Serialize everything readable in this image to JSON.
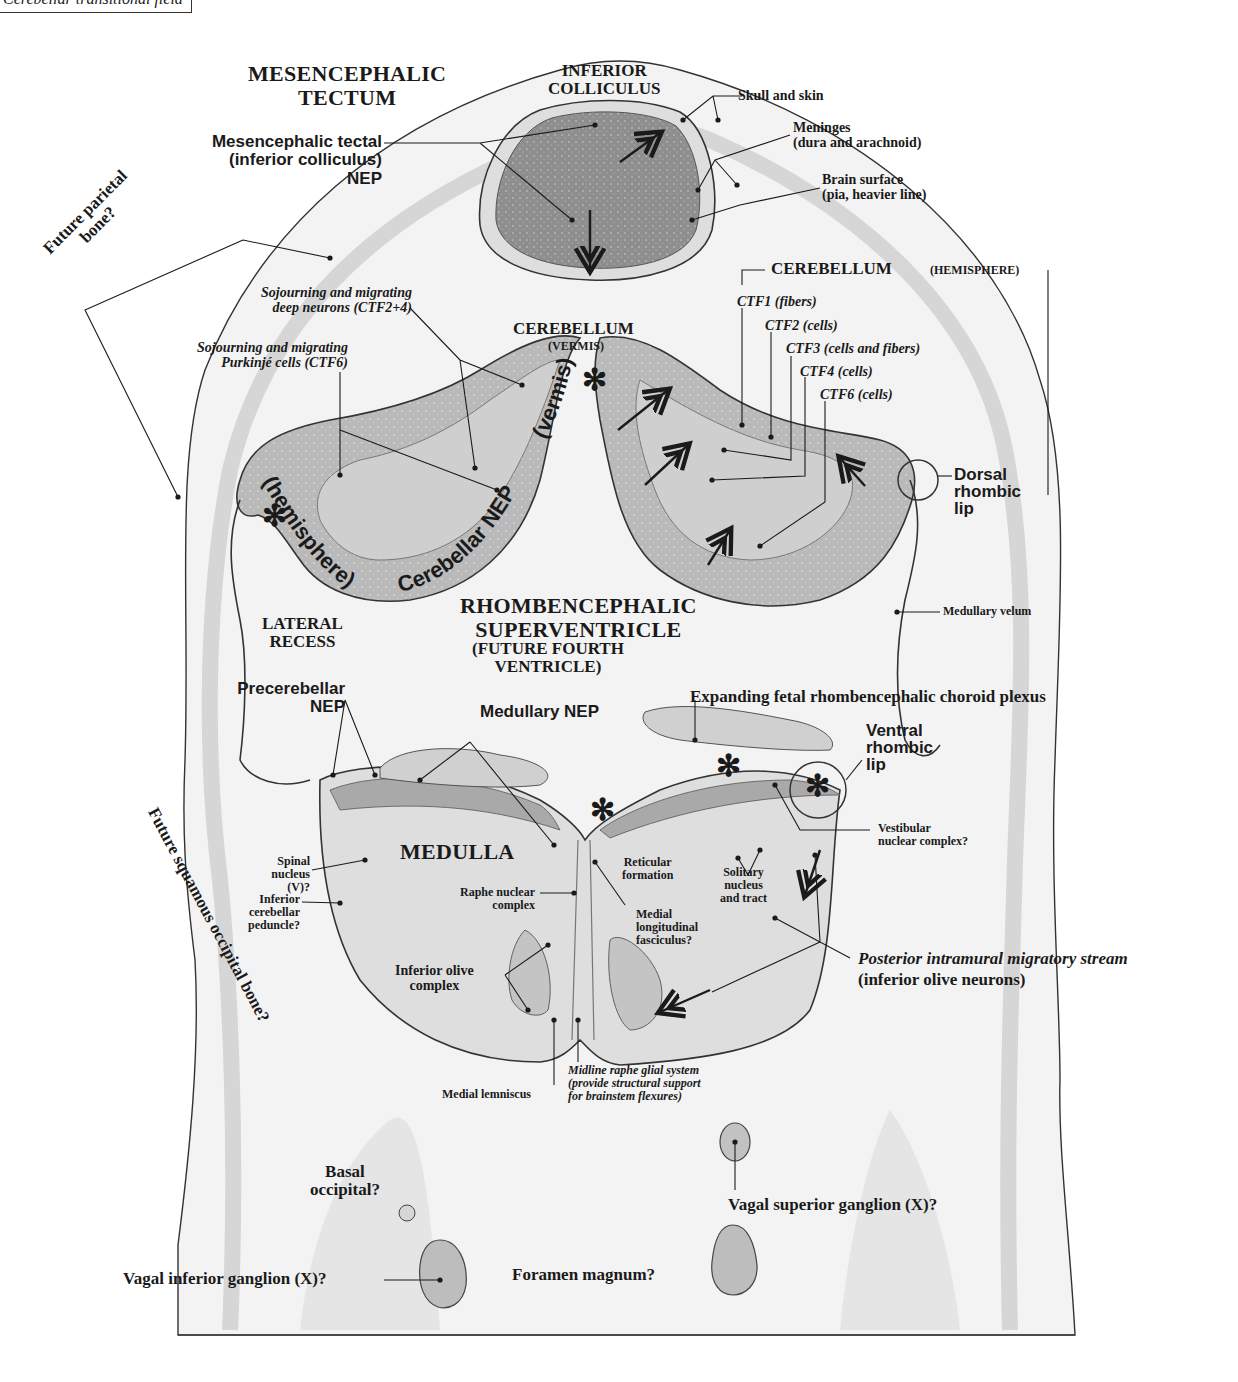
{
  "figure": {
    "header_tab": "Cerebellar transitional field",
    "regions": {
      "mesencephalic_tectum": "MESENCEPHALIC\nTECTUM",
      "inferior_colliculus": "INFERIOR\nCOLLICULUS",
      "cerebellum_vermis": "CEREBELLUM",
      "cerebellum_vermis_sub": "(VERMIS)",
      "cerebellum_hemisphere": "CEREBELLUM",
      "cerebellum_hemisphere_sub": "(HEMISPHERE)",
      "rhombencephalic_superventricle": "RHOMBENCEPHALIC\nSUPERVENTRICLE",
      "future_fourth_ventricle": "(FUTURE FOURTH\nVENTRICLE)",
      "lateral_recess": "LATERAL\nRECESS",
      "medulla": "MEDULLA"
    },
    "labels": {
      "skull_and_skin": "Skull and skin",
      "meninges": "Meninges\n(dura and arachnoid)",
      "brain_surface": "Brain surface\n(pia, heavier line)",
      "mesencephalic_tectal_nep": "Mesencephalic tectal\n(inferior colliculus)\nNEP",
      "future_parietal_bone": "Future parietal\nbone?",
      "sojourning_deep_neurons": "Sojourning and migrating\ndeep neurons (CTF2+4)",
      "sojourning_purkinje": "Sojourning and migrating\nPurkinjé cells (CTF6)",
      "ctf1": "CTF1 (fibers)",
      "ctf2": "CTF2 (cells)",
      "ctf3": "CTF3 (cells and fibers)",
      "ctf4": "CTF4 (cells)",
      "ctf6": "CTF6 (cells)",
      "hemisphere_curved": "(hemisphere)",
      "cerebellar_nep_curved": "Cerebellar NEP",
      "vermis_curved": "(vermis)",
      "dorsal_rhombic_lip": "Dorsal\nrhombic\nlip",
      "medullary_velum": "Medullary velum",
      "precerebellar_nep": "Precerebellar\nNEP",
      "medullary_nep": "Medullary NEP",
      "choroid_plexus": "Expanding fetal rhombencephalic choroid plexus",
      "ventral_rhombic_lip": "Ventral\nrhombic\nlip",
      "vestibular_nuclear_complex": "Vestibular\nnuclear complex?",
      "spinal_nucleus": "Spinal\nnucleus\n(V)?",
      "inferior_cerebellar_peduncle": "Inferior\ncerebellar\npeduncle?",
      "raphe_nuclear_complex": "Raphe nuclear\ncomplex",
      "reticular_formation": "Reticular\nformation",
      "solitary_nucleus": "Solitary\nnucleus\nand tract",
      "medial_longitudinal_fasciculus": "Medial\nlongitudinal\nfasciculus?",
      "inferior_olive_complex": "Inferior olive\ncomplex",
      "posterior_stream": "Posterior intramural migratory stream",
      "posterior_stream_sub": "(inferior olive neurons)",
      "medial_lemniscus": "Medial lemniscus",
      "midline_raphe": "Midline raphe glial system\n(provide structural support\nfor brainstem flexures)",
      "future_squamous_occipital": "Future squamous occipital bone?",
      "basal_occipital": "Basal\noccipital?",
      "vagal_superior_ganglion": "Vagal superior ganglion (X)?",
      "vagal_inferior_ganglion": "Vagal inferior ganglion (X)?",
      "foramen_magnum": "Foramen magnum?"
    },
    "symbols": {
      "asterisk_glyph": "✻"
    },
    "colors": {
      "ink": "#1a1a1a",
      "tissue_light": "#e6e6e6",
      "tissue_mid": "#c4c4c4",
      "tissue_dark": "#9a9a9a",
      "skull_shade": "#efefef"
    }
  }
}
